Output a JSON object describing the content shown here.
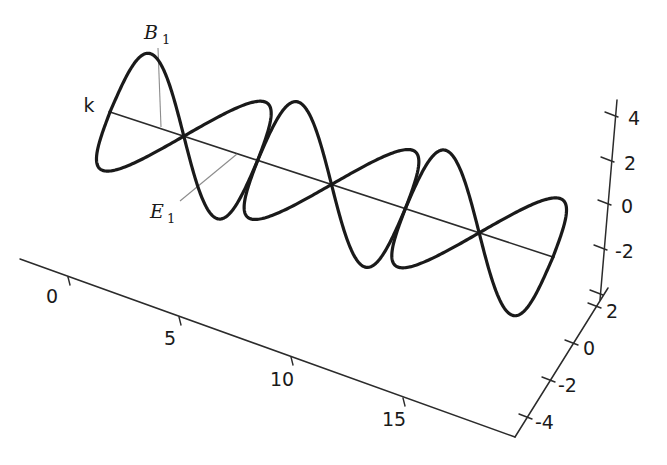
{
  "figure": {
    "title": ""
  },
  "annotations": {
    "propagation_label": "k",
    "magnetic_label": "B",
    "magnetic_subscript": "1",
    "electric_label": "E",
    "electric_subscript": "1"
  },
  "chart_data": {
    "type": "line",
    "title": "",
    "xlabel": "",
    "ylabel": "",
    "zlabel": "",
    "projection": "3d",
    "grid": false,
    "legend": null,
    "axes": {
      "propagation_axis": {
        "name": "k",
        "tick_labels": [
          "0",
          "5",
          "10",
          "15"
        ],
        "tick_values": [
          0,
          5,
          10,
          15
        ],
        "range": [
          -2,
          20
        ]
      },
      "vertical_axis": {
        "name": "B",
        "tick_labels": [
          "4",
          "2",
          "0",
          "-2"
        ],
        "tick_values": [
          4,
          2,
          0,
          -2
        ],
        "range": [
          -4,
          5
        ]
      },
      "depth_axis": {
        "name": "E",
        "tick_labels": [
          "2",
          "0",
          "-2",
          "-4"
        ],
        "tick_values": [
          2,
          0,
          -2,
          -4
        ],
        "range": [
          -5,
          4
        ]
      }
    },
    "series": [
      {
        "name": "B1",
        "plane": "vertical",
        "form": "amplitude * sin(k * x)",
        "amplitude": 4,
        "wavelength": 6.28,
        "cycles": 3,
        "phase": 0,
        "color": "#1a1a1a"
      },
      {
        "name": "E1",
        "plane": "horizontal",
        "form": "amplitude * sin(k * x)",
        "amplitude": 4,
        "wavelength": 6.28,
        "cycles": 3,
        "phase": 0,
        "color": "#1a1a1a"
      }
    ]
  },
  "colors": {
    "background": "#ffffff",
    "curve": "#1a1a1a",
    "axis": "#2b2b2b",
    "leader": "#8c8c8c"
  }
}
